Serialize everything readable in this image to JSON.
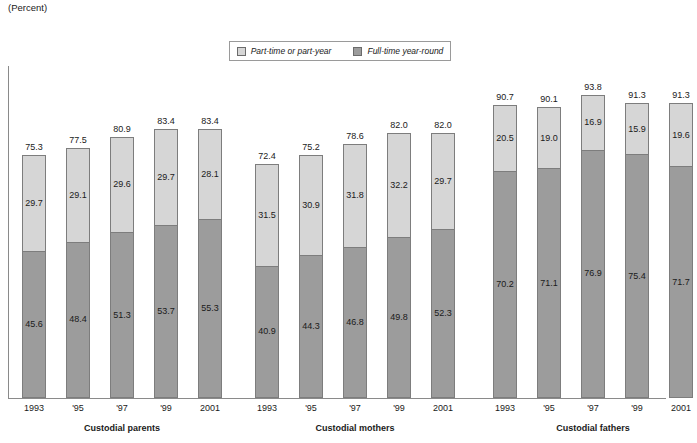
{
  "unit_note": "(Percent)",
  "legend": {
    "entries": [
      {
        "label": "Part-time or part-year",
        "color": "#d6d6d6",
        "swatch": "light"
      },
      {
        "label": "Full-time year-round",
        "color": "#9c9c9c",
        "swatch": "dark"
      }
    ]
  },
  "groups": [
    {
      "title": "Custodial parents"
    },
    {
      "title": "Custodial mothers"
    },
    {
      "title": "Custodial fathers"
    }
  ],
  "chart_data": {
    "type": "bar",
    "title": "",
    "subtitle": "",
    "xlabel": "",
    "ylabel": "(Percent)",
    "ylim": [
      0,
      100
    ],
    "grid": false,
    "stacked": true,
    "legend_position": "top-center",
    "categories": [
      "1993",
      "'95",
      "'97",
      "'99",
      "2001"
    ],
    "groups": [
      {
        "name": "Custodial parents",
        "totals": [
          75.3,
          77.5,
          80.9,
          83.4,
          83.4
        ],
        "series": [
          {
            "name": "Full-time year-round",
            "values": [
              45.6,
              48.4,
              51.3,
              53.7,
              55.3
            ]
          },
          {
            "name": "Part-time or part-year",
            "values": [
              29.7,
              29.1,
              29.6,
              29.7,
              28.1
            ]
          }
        ]
      },
      {
        "name": "Custodial mothers",
        "totals": [
          72.4,
          75.2,
          78.6,
          82.0,
          82.0
        ],
        "series": [
          {
            "name": "Full-time year-round",
            "values": [
              40.9,
              44.3,
              46.8,
              49.8,
              52.3
            ]
          },
          {
            "name": "Part-time or part-year",
            "values": [
              31.5,
              30.9,
              31.8,
              32.2,
              29.7
            ]
          }
        ]
      },
      {
        "name": "Custodial fathers",
        "totals": [
          90.7,
          90.1,
          93.8,
          91.3,
          91.3
        ],
        "series": [
          {
            "name": "Full-time year-round",
            "values": [
              70.2,
              71.1,
              76.9,
              75.4,
              71.7
            ]
          },
          {
            "name": "Part-time or part-year",
            "values": [
              20.5,
              19.0,
              16.9,
              15.9,
              19.6
            ]
          }
        ]
      }
    ]
  },
  "labels": {
    "totals": {
      "parents": [
        "75.3",
        "77.5",
        "80.9",
        "83.4",
        "83.4"
      ],
      "mothers": [
        "72.4",
        "75.2",
        "78.6",
        "82.0",
        "82.0"
      ],
      "fathers": [
        "90.7",
        "90.1",
        "93.8",
        "91.3",
        "91.3"
      ]
    },
    "part_time": {
      "parents": [
        "29.7",
        "29.1",
        "29.6",
        "29.7",
        "28.1"
      ],
      "mothers": [
        "31.5",
        "30.9",
        "31.8",
        "32.2",
        "29.7"
      ],
      "fathers": [
        "20.5",
        "19.0",
        "16.9",
        "15.9",
        "19.6"
      ]
    },
    "full_time": {
      "parents": [
        "45.6",
        "48.4",
        "51.3",
        "53.7",
        "55.3"
      ],
      "mothers": [
        "40.9",
        "44.3",
        "46.8",
        "49.8",
        "52.3"
      ],
      "fathers": [
        "70.2",
        "71.1",
        "76.9",
        "75.4",
        "71.7"
      ]
    }
  }
}
